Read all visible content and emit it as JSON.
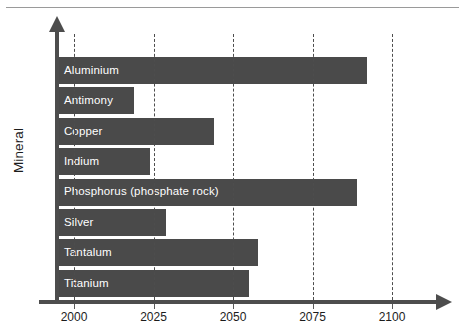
{
  "chart_data": {
    "type": "bar",
    "orientation": "horizontal",
    "title": "",
    "xlabel": "",
    "ylabel": "Mineral",
    "xlim": [
      1994,
      2120
    ],
    "xticks": [
      2000,
      2025,
      2050,
      2075,
      2100
    ],
    "xtick_labels": [
      "2000",
      "2025",
      "2050",
      "2075",
      "2100"
    ],
    "grid": "vertical-dashed",
    "legend": "none",
    "bar_start": 1994,
    "categories": [
      "Aluminium",
      "Antimony",
      "Copper",
      "Indium",
      "Phosphorus (phosphate rock)",
      "Silver",
      "Tantalum",
      "Titanium"
    ],
    "values": [
      2092,
      2019,
      2044,
      2024,
      2089,
      2029,
      2058,
      2055
    ],
    "bars": [
      {
        "label": "Aluminium",
        "value": 2092
      },
      {
        "label": "Antimony",
        "value": 2019
      },
      {
        "label": "Copper",
        "value": 2044
      },
      {
        "label": "Indium",
        "value": 2024
      },
      {
        "label": "Phosphorus (phosphate rock)",
        "value": 2089
      },
      {
        "label": "Silver",
        "value": 2029
      },
      {
        "label": "Tantalum",
        "value": 2058
      },
      {
        "label": "Titanium",
        "value": 2055
      }
    ],
    "colors": {
      "bar": "#4a4a4a",
      "bar_label": "#ffffff",
      "axis": "#4d4d4d",
      "gridline": "#4d4d4d",
      "tick_label": "#1c1c1c",
      "background": "#ffffff",
      "top_rule": "#9a9a9a"
    }
  }
}
